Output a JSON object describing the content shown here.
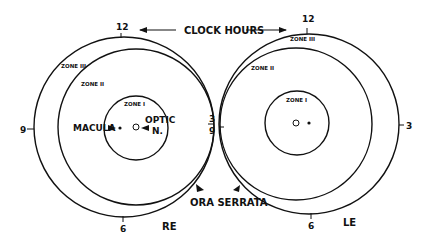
{
  "title": "CLOCK HOURS",
  "eyes": {
    "right": {
      "label": "RE",
      "clock_hours": {
        "twelve": "12",
        "nine": "9",
        "three": "3",
        "six": "6"
      },
      "zones": {
        "zone1": "ZONE I",
        "zone2": "ZONE II",
        "zone3": "ZONE III"
      },
      "macula_label": "MACULA",
      "optic_label_1": "OPTIC",
      "optic_label_2": "N."
    },
    "left": {
      "label": "LE",
      "clock_hours": {
        "twelve": "12",
        "nine": "9",
        "three": "3",
        "six": "6"
      },
      "zones": {
        "zone1": "ZONE I",
        "zone2": "ZONE II",
        "zone3": "ZONE III"
      }
    }
  },
  "ora_serrata": "ORA SERRATA",
  "colors": {
    "ink": "#111111",
    "background": "#ffffff"
  }
}
